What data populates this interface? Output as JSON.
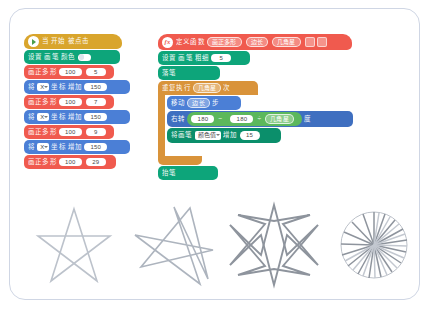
{
  "app": {
    "type": "block-based-visual-programming-editor",
    "language": "zh-CN"
  },
  "scripts": {
    "main_stack": {
      "name": "main-script",
      "hat": {
        "icon": "green-flag-icon",
        "label": "当 开始 被点击"
      },
      "rows": [
        {
          "kind": "pen-toggle",
          "label": "设置 画笔 颜色",
          "toggle_state": "off"
        },
        {
          "kind": "call",
          "label": "画正多形",
          "args": [
            "100",
            "5"
          ]
        },
        {
          "kind": "motion",
          "prefix": "将",
          "axis": "X",
          "middle": "坐标 增加",
          "value": "150"
        },
        {
          "kind": "call",
          "label": "画正多形",
          "args": [
            "100",
            "7"
          ]
        },
        {
          "kind": "motion",
          "prefix": "将",
          "axis": "X",
          "middle": "坐标 增加",
          "value": "150"
        },
        {
          "kind": "call",
          "label": "画正多形",
          "args": [
            "100",
            "9"
          ]
        },
        {
          "kind": "motion",
          "prefix": "将",
          "axis": "X",
          "middle": "坐标 增加",
          "value": "150"
        },
        {
          "kind": "call",
          "label": "画正多形",
          "args": [
            "100",
            "29"
          ]
        }
      ]
    },
    "definition_stack": {
      "name": "function-definition",
      "header": {
        "icon": "function-badge-icon",
        "define_label": "定义函数",
        "function_name": "画正多形",
        "params": [
          "边长",
          "几角星"
        ],
        "buttons": [
          "minus-button",
          "plus-button"
        ]
      },
      "rows": [
        {
          "kind": "pen-size",
          "label": "设置 画笔 粗细",
          "value": "5"
        },
        {
          "kind": "pen-down",
          "label": "落笔"
        },
        {
          "kind": "repeat",
          "label_before": "重复执行",
          "times_param": "几角星",
          "label_after": "次"
        },
        {
          "kind": "move",
          "label_before": "移动",
          "param": "边长",
          "label_after": "步"
        },
        {
          "kind": "turn",
          "label_before": "右转",
          "operand_a": "180",
          "op1": "−",
          "operand_b": "180",
          "op2": "÷",
          "operand_c": "几角星",
          "label_after": "度"
        },
        {
          "kind": "pen-change",
          "label_before": "将画笔",
          "property": "颜色值",
          "label_mid": "增加",
          "value": "15"
        },
        {
          "kind": "pen-up",
          "label": "抬笔"
        }
      ]
    }
  },
  "outputs": {
    "name": "drawn-star-results",
    "items": [
      {
        "label": "5",
        "points": 5,
        "stroke": "#b9bfc9"
      },
      {
        "label": "7",
        "points": 7,
        "stroke": "#a9b0ba"
      },
      {
        "label": "9",
        "points": 9,
        "stroke": "#8e949d"
      },
      {
        "label": "29",
        "points": 29,
        "stroke": "#9aa1aa"
      }
    ]
  },
  "colors": {
    "event": "#d9a52c",
    "pen": "#0da57a",
    "motion": "#4b7fd6",
    "control": "#d9933a",
    "my_block": "#f05a4e",
    "operator": "#5cb85c",
    "panel_border": "#cfd6e4"
  }
}
